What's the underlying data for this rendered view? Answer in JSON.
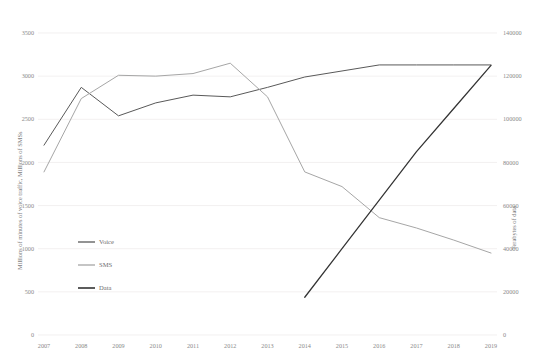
{
  "chart_data": {
    "type": "line",
    "title": "",
    "x": [
      2007,
      2008,
      2009,
      2010,
      2011,
      2012,
      2013,
      2014,
      2015,
      2016,
      2017,
      2018,
      2019
    ],
    "categories": [
      "2007",
      "2008",
      "2009",
      "2010",
      "2011",
      "2012",
      "2013",
      "2014",
      "2015",
      "2016",
      "2017",
      "2018",
      "2019"
    ],
    "xlabel": "",
    "ylabel": "Millions of minutes of voice traffic, Millions of SMSs",
    "y2label": "Terabytes of data",
    "ylim": [
      0,
      3500
    ],
    "y2lim": [
      0,
      140000
    ],
    "yticks": [
      0,
      500,
      1000,
      1500,
      2000,
      2500,
      3000,
      3500
    ],
    "ytick_labels": [
      "0",
      "500",
      "1000",
      "1500",
      "2000",
      "2500",
      "3000",
      "3500"
    ],
    "y2ticks": [
      0,
      20000,
      40000,
      60000,
      80000,
      100000,
      120000,
      140000
    ],
    "y2tick_labels": [
      "0",
      "20000",
      "40000",
      "60000",
      "80000",
      "100000",
      "120000",
      "140000"
    ],
    "grid": true,
    "legend_position": "inner-left",
    "series": [
      {
        "name": "Voice",
        "axis": "left",
        "color": "#595959",
        "values": [
          2200,
          2870,
          2540,
          2690,
          2780,
          2760,
          2870,
          2990,
          3060,
          3130,
          3130,
          3130,
          3130
        ]
      },
      {
        "name": "SMS",
        "axis": "left",
        "color": "#a6a6a6",
        "values": [
          1890,
          2740,
          3010,
          3000,
          3030,
          3150,
          2760,
          1890,
          1720,
          1360,
          1240,
          1100,
          950
        ]
      },
      {
        "name": "Data",
        "axis": "right",
        "color": "#333333",
        "values": [
          null,
          null,
          null,
          null,
          null,
          null,
          null,
          17500,
          40000,
          62500,
          85000,
          105000,
          125000
        ]
      }
    ]
  },
  "legend": {
    "items": [
      {
        "label": "Voice",
        "color": "#595959"
      },
      {
        "label": "SMS",
        "color": "#a6a6a6"
      },
      {
        "label": "Data",
        "color": "#333333"
      }
    ]
  }
}
